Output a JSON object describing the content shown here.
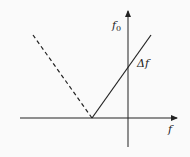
{
  "diagram": {
    "type": "frequency-relation-plot",
    "axes": {
      "x_label": "f",
      "y_label_main": "f",
      "y_label_sub": "0"
    },
    "annotations": {
      "delta_label": "Δf"
    },
    "lines": [
      {
        "name": "solid-branch",
        "style": "solid",
        "description": "rises from vertex on negative x-axis through y-axis intercept Δf"
      },
      {
        "name": "dashed-branch",
        "style": "dashed",
        "description": "mirror branch rising to upper-left from vertex"
      }
    ],
    "colors": {
      "stroke": "#222222",
      "background": "#fafafa"
    }
  }
}
